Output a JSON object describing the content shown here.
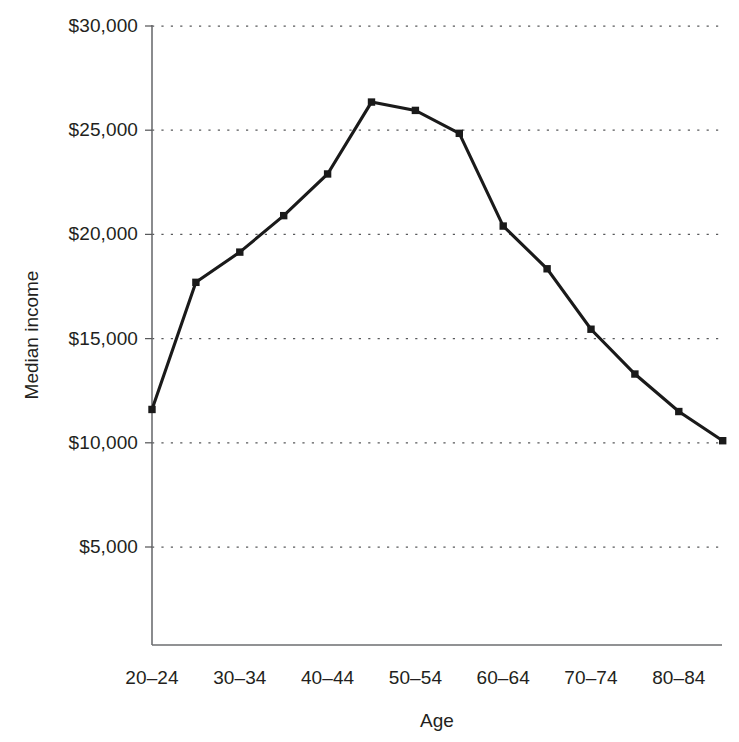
{
  "chart_data": {
    "type": "line",
    "title": "",
    "xlabel": "Age",
    "ylabel": "Median income",
    "categories": [
      "20–24",
      "25–29",
      "30–34",
      "35–39",
      "40–44",
      "45–49",
      "50–54",
      "55–59",
      "60–64",
      "65–69",
      "70–74",
      "75–79",
      "80–84",
      "85+"
    ],
    "values": [
      11600,
      17700,
      19150,
      20900,
      22900,
      26350,
      25950,
      24850,
      20400,
      18350,
      15450,
      13300,
      11500,
      10100
    ],
    "ylim": [
      0,
      30000
    ],
    "yticks": [
      5000,
      10000,
      15000,
      20000,
      25000,
      30000
    ],
    "ytick_labels": [
      "$5,000",
      "$10,000",
      "$15,000",
      "$20,000",
      "$25,000",
      "$30,000"
    ],
    "xtick_labels": [
      "20–24",
      "30–34",
      "40–44",
      "50–54",
      "60–64",
      "70–74",
      "80–84"
    ],
    "xtick_indices": [
      0,
      2,
      4,
      6,
      8,
      10,
      12
    ],
    "grid": "horizontal-dotted",
    "legend": "none",
    "line_color": "#1a1a1a",
    "marker": "square",
    "marker_color": "#1a1a1a"
  },
  "axes": {
    "y_title": "Median income",
    "x_title": "Age"
  }
}
